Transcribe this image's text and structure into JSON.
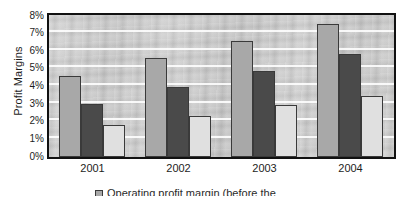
{
  "chart_data": {
    "type": "bar",
    "title": "",
    "subtitle": "",
    "xlabel": "",
    "ylabel": "Profit Margins",
    "categories": [
      "2001",
      "2002",
      "2003",
      "2004"
    ],
    "ylim": [
      0,
      8
    ],
    "ytick_labels": [
      "0%",
      "1%",
      "2%",
      "3%",
      "4%",
      "5%",
      "6%",
      "7%",
      "8%"
    ],
    "ytick_values": [
      0,
      1,
      2,
      3,
      4,
      5,
      6,
      7,
      8
    ],
    "yunit": "%",
    "grid": "horizontal",
    "legend_position": "bottom",
    "series": [
      {
        "name": "Operating profit margin (before the",
        "color": "#a8a8a8",
        "values": [
          4.6,
          5.6,
          6.6,
          7.55
        ]
      },
      {
        "name": "",
        "color": "#4a4a4a",
        "values": [
          3.0,
          3.95,
          4.9,
          5.85
        ]
      },
      {
        "name": "",
        "color": "#e0e0e0",
        "values": [
          1.8,
          2.35,
          2.95,
          3.45
        ]
      }
    ]
  },
  "legend": {
    "note_clipped": "Operating profit margin (before the",
    "entries": [
      {
        "label": "Operating profit margin (before the",
        "color": "#a8a8a8"
      }
    ]
  },
  "colors": {
    "series_1": "#a8a8a8",
    "series_2": "#4a4a4a",
    "series_3": "#e0e0e0",
    "frame": "#111111",
    "plot_background": "#c9c9c9",
    "gridline": "#ffffff",
    "text": "#1d1d1d"
  }
}
